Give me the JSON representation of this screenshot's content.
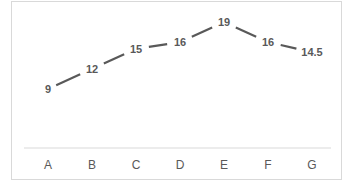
{
  "chart_data": {
    "type": "line",
    "title": "",
    "xlabel": "",
    "ylabel": "",
    "categories": [
      "A",
      "B",
      "C",
      "D",
      "E",
      "F",
      "G"
    ],
    "series": [
      {
        "name": "Series 1",
        "values": [
          9,
          12,
          15,
          16,
          19,
          16,
          14.5
        ],
        "color": "#595959"
      }
    ],
    "data_labels": [
      "9",
      "12",
      "15",
      "16",
      "19",
      "16",
      "14.5"
    ],
    "grid": false,
    "legend": "none",
    "y_axis_visible": false
  }
}
